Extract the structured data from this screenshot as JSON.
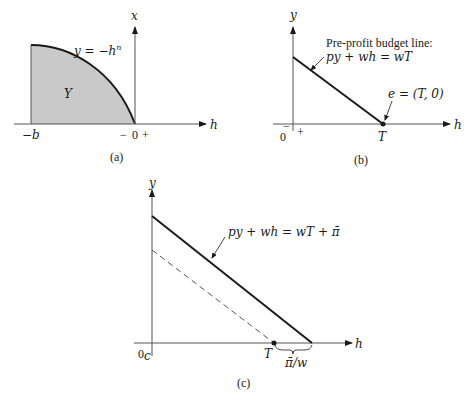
{
  "colors": {
    "ink": "#1a1a1a",
    "shade": "#c9c9c9",
    "axis": "#555555"
  },
  "panel_a": {
    "caption": "(a)",
    "vertical_axis_label": "x",
    "horizontal_axis_label": "h",
    "curve_label": "y = −h",
    "curve_label_exponent": "n",
    "region_label": "Y",
    "left_bound_label": "−b",
    "origin_minus": "−",
    "origin_label": "0",
    "origin_plus": "+"
  },
  "panel_b": {
    "caption": "(b)",
    "vertical_axis_label": "y",
    "horizontal_axis_label": "h",
    "budget_title": "Pre-profit budget line:",
    "budget_equation": "py + wh = wT",
    "endowment_label": "e = (T, 0)",
    "t_label": "T",
    "origin_label": "0",
    "origin_minus": "−",
    "origin_plus": "+"
  },
  "panel_c": {
    "caption": "(c)",
    "vertical_axis_label": "y",
    "horizontal_axis_label": "h",
    "budget_equation": "py + wh = wT + π̄",
    "origin_label": "0",
    "origin_subscript": "c",
    "t_label": "T",
    "shift_label": "π̄/w"
  }
}
